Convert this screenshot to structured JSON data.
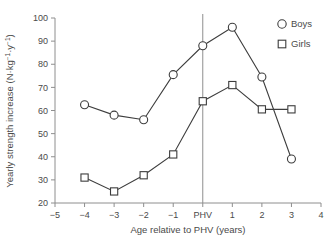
{
  "chart_data": {
    "type": "line",
    "title": "",
    "xlabel": "Age relative to PHV (years)",
    "ylabel": "Yearly strength increase (N·kg⁻¹·y⁻¹)",
    "x": [
      -4,
      -3,
      -2,
      -1,
      0,
      1,
      2,
      3
    ],
    "x_tick_values": [
      -5,
      -4,
      -3,
      -2,
      -1,
      0,
      1,
      2,
      3,
      4
    ],
    "x_tick_labels": [
      "−5",
      "−4",
      "−3",
      "−2",
      "−1",
      "PHV",
      "1",
      "2",
      "3",
      "4"
    ],
    "y_tick_values": [
      20,
      30,
      40,
      50,
      60,
      70,
      80,
      90,
      100
    ],
    "y_tick_labels": [
      "20",
      "30",
      "40",
      "50",
      "60",
      "70",
      "80",
      "90",
      "100"
    ],
    "xlim": [
      -5,
      4
    ],
    "ylim": [
      20,
      100
    ],
    "grid": false,
    "legend_position": "top-right",
    "reference_line": {
      "x": 0,
      "label": "PHV"
    },
    "series": [
      {
        "name": "Boys",
        "marker": "circle",
        "values": [
          62.5,
          58.0,
          56.0,
          75.5,
          88.0,
          96.0,
          74.5,
          39.0
        ]
      },
      {
        "name": "Girls",
        "marker": "square",
        "values": [
          31.0,
          25.0,
          32.0,
          41.0,
          64.0,
          71.0,
          60.5,
          60.5
        ]
      }
    ]
  },
  "ylabel_parts": {
    "main": "Yearly strength increase (N·kg",
    "sup1": "−1",
    "mid": "·y",
    "sup2": "−1",
    "tail": ")"
  },
  "legend": {
    "items": [
      {
        "label": "Boys",
        "marker": "circle"
      },
      {
        "label": "Girls",
        "marker": "square"
      }
    ]
  }
}
